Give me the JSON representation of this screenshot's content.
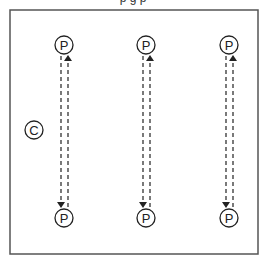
{
  "caption_clipped": "p                                 g p",
  "diagram": {
    "frame": {
      "x": 10,
      "y": 10,
      "width": 248,
      "height": 244,
      "stroke": "#555555"
    },
    "center_node": {
      "label": "C",
      "cx": 34,
      "cy": 130,
      "r": 9
    },
    "columns": [
      {
        "top": {
          "label": "P",
          "cx": 64,
          "cy": 45
        },
        "bottom": {
          "label": "P",
          "cx": 64,
          "cy": 218
        }
      },
      {
        "top": {
          "label": "P",
          "cx": 146,
          "cy": 45
        },
        "bottom": {
          "label": "P",
          "cx": 146,
          "cy": 218
        }
      },
      {
        "top": {
          "label": "P",
          "cx": 229,
          "cy": 45
        },
        "bottom": {
          "label": "P",
          "cx": 229,
          "cy": 218
        }
      }
    ],
    "node_radius": 9,
    "line_color": "#222222"
  }
}
